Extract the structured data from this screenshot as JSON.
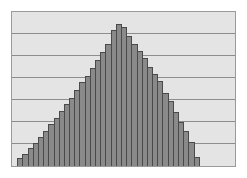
{
  "chart_data": {
    "type": "bar",
    "title": "",
    "subtitle": "",
    "xlabel": "",
    "ylabel": "",
    "legend": [],
    "legend_position": "none",
    "grid": true,
    "grid_orientation": "horizontal",
    "gridline_count": 6,
    "gridline_values": [
      1,
      2,
      3,
      4,
      5,
      6
    ],
    "xlim": [
      0,
      36
    ],
    "ylim": [
      0,
      7
    ],
    "xtick_labels": [],
    "ytick_labels": [],
    "annotations": [],
    "bar_count": 36,
    "categories": [
      "1",
      "2",
      "3",
      "4",
      "5",
      "6",
      "7",
      "8",
      "9",
      "10",
      "11",
      "12",
      "13",
      "14",
      "15",
      "16",
      "17",
      "18",
      "19",
      "20",
      "21",
      "22",
      "23",
      "24",
      "25",
      "26",
      "27",
      "28",
      "29",
      "30",
      "31",
      "32",
      "33",
      "34",
      "35",
      "36"
    ],
    "values": [
      0.0,
      0.35,
      0.55,
      0.8,
      1.05,
      1.3,
      1.6,
      1.9,
      2.2,
      2.5,
      2.8,
      3.1,
      3.45,
      3.8,
      4.1,
      4.45,
      4.8,
      5.2,
      5.55,
      6.2,
      6.45,
      6.3,
      5.9,
      5.55,
      5.25,
      4.9,
      4.5,
      4.2,
      3.85,
      3.3,
      2.95,
      2.45,
      2.0,
      1.6,
      1.1,
      0.4
    ],
    "series": [
      {
        "name": "frequency",
        "values": [
          0.0,
          0.35,
          0.55,
          0.8,
          1.05,
          1.3,
          1.6,
          1.9,
          2.2,
          2.5,
          2.8,
          3.1,
          3.45,
          3.8,
          4.1,
          4.45,
          4.8,
          5.2,
          5.55,
          6.2,
          6.45,
          6.3,
          5.9,
          5.55,
          5.25,
          4.9,
          4.5,
          4.2,
          3.85,
          3.3,
          2.95,
          2.45,
          2.0,
          1.6,
          1.1,
          0.4
        ]
      }
    ],
    "peak_index": 20,
    "peak_value": 6.45,
    "colors": {
      "bar_fill": "#8a8a8a",
      "bar_edge": "#4a4a4a",
      "plot_background": "#e4e4e4",
      "gridline": "#8d8d8d",
      "frame_border": "#9a9a9a",
      "page_background": "#ffffff"
    }
  }
}
